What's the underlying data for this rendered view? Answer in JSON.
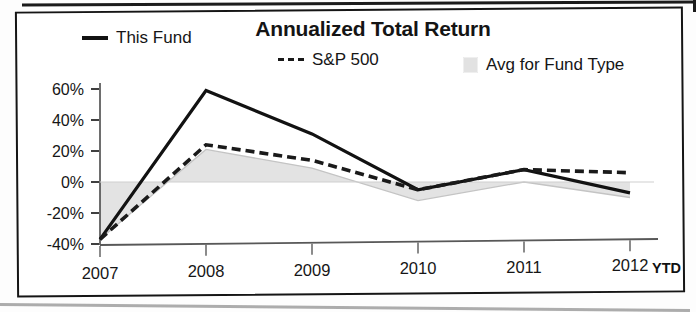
{
  "chart_data": {
    "type": "line",
    "title": "Annualized Total Return",
    "xlabel": "",
    "ylabel": "",
    "x": [
      "2007",
      "2008",
      "2009",
      "2010",
      "2011",
      "2012"
    ],
    "categories": [
      "2007",
      "2008",
      "2009",
      "2010",
      "2011",
      "2012"
    ],
    "x_axis_note": "YTD",
    "ylim": [
      -40,
      60
    ],
    "ytick_values": [
      60,
      40,
      20,
      0,
      -20,
      -40
    ],
    "ytick_labels": [
      "60%",
      "40%",
      "20%",
      "0%",
      "-20%",
      "-40%"
    ],
    "grid": false,
    "legend_position": "top",
    "baseline": 0,
    "series": [
      {
        "name": "This Fund",
        "style": "solid",
        "color": "#121212",
        "values": [
          -37,
          59,
          31,
          -5,
          8,
          -7
        ]
      },
      {
        "name": "S&P 500",
        "style": "dashed",
        "color": "#1a1a1a",
        "values": [
          -37,
          24,
          14,
          -5,
          8,
          6
        ]
      },
      {
        "name": "Avg for Fund Type",
        "style": "area",
        "color": "#e2e2e2",
        "values": [
          -37,
          21,
          9,
          -12,
          0,
          -10
        ]
      }
    ]
  },
  "legend": {
    "this_fund": "This Fund",
    "sp500": "S&P 500",
    "avg_fund_type": "Avg for Fund Type"
  },
  "axis": {
    "ytick_0": "60%",
    "ytick_1": "40%",
    "ytick_2": "20%",
    "ytick_3": "0%",
    "ytick_4": "-20%",
    "ytick_5": "-40%",
    "xtick_0": "2007",
    "xtick_1": "2008",
    "xtick_2": "2009",
    "xtick_3": "2010",
    "xtick_4": "2011",
    "xtick_5": "2012",
    "ytd": "YTD"
  },
  "colors": {
    "fund_line": "#121212",
    "benchmark_line": "#1a1a1a",
    "area_fill": "#e2e2e2",
    "frame": "#151515",
    "text": "#141414"
  }
}
